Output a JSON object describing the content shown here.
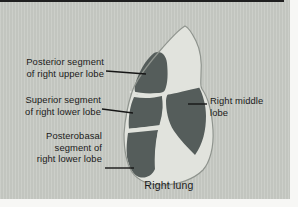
{
  "figure": {
    "type": "anatomical-diagram",
    "caption": "Right lung",
    "labels": [
      {
        "id": "posterior-upper",
        "lines": [
          "Posterior segment",
          "of right upper lobe"
        ]
      },
      {
        "id": "superior-lower",
        "lines": [
          "Superior segment",
          "of right lower lobe"
        ]
      },
      {
        "id": "posterobasal-lower",
        "lines": [
          "Posterobasal",
          "segment of",
          "right lower lobe"
        ]
      },
      {
        "id": "right-middle",
        "lines": [
          "Right middle",
          "lobe"
        ]
      }
    ],
    "colors": {
      "panel_background": "#c8cbc5",
      "page_margin": "#f7f7f5",
      "top_rule": "#202020",
      "lung_fill": "#e1e3dd",
      "lung_outline": "#8f948e",
      "segment_fill": "#555d5b",
      "fissure_line": "#e1e3dd",
      "leader_line": "#161616",
      "text": "#1a1a1a"
    }
  }
}
